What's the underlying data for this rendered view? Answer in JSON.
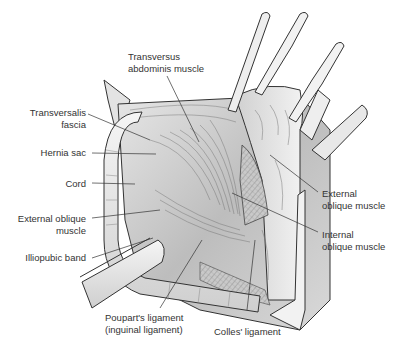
{
  "figure": {
    "colors": {
      "line": "#333333",
      "tissue": "#d8d8d8",
      "shade": "#b5b5b5",
      "light": "#efefef",
      "background": "#ffffff"
    }
  },
  "labels": {
    "transversus_abdominis": {
      "line1": "Transversus",
      "line2": "abdominis muscle"
    },
    "transversalis_fascia": {
      "line1": "Transversalis",
      "line2": "fascia"
    },
    "hernia_sac": {
      "line1": "Hernia sac"
    },
    "cord": {
      "line1": "Cord"
    },
    "external_oblique_left": {
      "line1": "External oblique",
      "line2": "muscle"
    },
    "iliopubic_band": {
      "line1": "Illiopubic band"
    },
    "pouparts_ligament": {
      "line1": "Poupart's ligament",
      "line2": "(inguinal ligament)"
    },
    "colles_ligament": {
      "line1": "Colles' ligament"
    },
    "external_oblique_right": {
      "line1": "External",
      "line2": "oblique muscle"
    },
    "internal_oblique": {
      "line1": "Internal",
      "line2": "oblique muscle"
    }
  }
}
